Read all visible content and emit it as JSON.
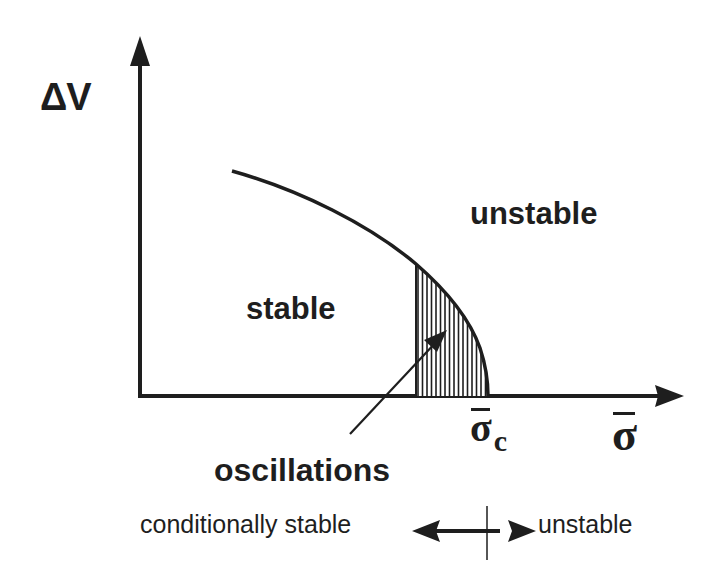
{
  "diagram": {
    "type": "stability phase diagram",
    "axes": {
      "y_label": "ΔV",
      "x_label": "σ̄",
      "x_tick_label_base": "σ",
      "x_tick_label_sub": "c"
    },
    "regions": {
      "stable": "stable",
      "unstable": "unstable",
      "oscillations": "oscillations"
    },
    "legend": {
      "left_label": "conditionally stable",
      "right_label": "unstable"
    },
    "colors": {
      "ink": "#1e1e1e",
      "background": "#ffffff"
    }
  }
}
